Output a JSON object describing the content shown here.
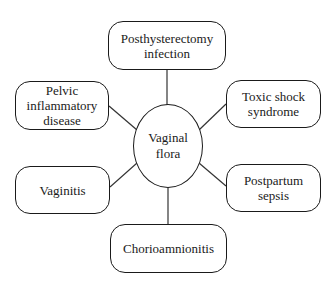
{
  "diagram": {
    "center": {
      "label": "Vaginal\nflora"
    },
    "nodes": [
      {
        "id": "posthysterectomy",
        "label": "Posthysterectomy\ninfection"
      },
      {
        "id": "pid",
        "label": "Pelvic\ninflammatory\ndisease"
      },
      {
        "id": "tss",
        "label": "Toxic shock\nsyndrome"
      },
      {
        "id": "vaginitis",
        "label": "Vaginitis"
      },
      {
        "id": "postpartum",
        "label": "Postpartum\nsepsis"
      },
      {
        "id": "chorio",
        "label": "Chorioamnionitis"
      }
    ],
    "edges": [
      [
        "center",
        "posthysterectomy"
      ],
      [
        "center",
        "pid"
      ],
      [
        "center",
        "tss"
      ],
      [
        "center",
        "vaginitis"
      ],
      [
        "center",
        "postpartum"
      ],
      [
        "center",
        "chorio"
      ]
    ]
  }
}
